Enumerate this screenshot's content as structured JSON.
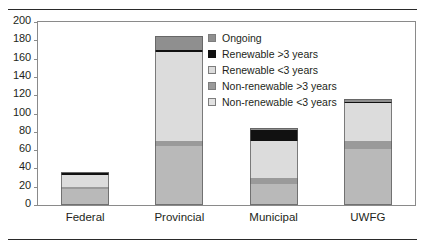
{
  "chart_data": {
    "type": "bar",
    "subtype": "stacked-vertical",
    "title": "",
    "xlabel": "",
    "ylabel": "",
    "ylim": [
      0,
      200
    ],
    "ytick_step": 20,
    "ytick_labels": [
      "0",
      "20",
      "40",
      "60",
      "80",
      "100",
      "120",
      "140",
      "160",
      "180",
      "200"
    ],
    "grid": false,
    "legend_position": "inside-top-right",
    "categories": [
      "Federal",
      "Provincial",
      "Municipal",
      "UWFG"
    ],
    "series": [
      {
        "name": "Non-renewable <3 years",
        "color": "#b9b9b9",
        "values": [
          18,
          65,
          23,
          61
        ]
      },
      {
        "name": "Non-renewable >3 years",
        "color": "#9a9a9a",
        "values": [
          2,
          5,
          7,
          9
        ]
      },
      {
        "name": "Renewable <3 years",
        "color": "#dcdcdc",
        "values": [
          13,
          97,
          40,
          42
        ]
      },
      {
        "name": "Renewable >3 years",
        "color": "#111111",
        "values": [
          2,
          2,
          12,
          1
        ]
      },
      {
        "name": "Ongoing",
        "color": "#8f8f8f",
        "values": [
          1,
          16,
          2,
          3
        ]
      }
    ],
    "stack_order_bottom_to_top": [
      "Non-renewable <3 years",
      "Non-renewable >3 years",
      "Renewable <3 years",
      "Renewable >3 years",
      "Ongoing"
    ],
    "totals": [
      36,
      185,
      84,
      116
    ],
    "legend_entries": [
      {
        "label": "Ongoing",
        "color": "#8f8f8f"
      },
      {
        "label": "Renewable >3 years",
        "color": "#111111"
      },
      {
        "label": "Renewable <3 years",
        "color": "#dcdcdc"
      },
      {
        "label": "Non-renewable >3 years",
        "color": "#9a9a9a"
      },
      {
        "label": "Non-renewable <3 years",
        "color": "#e2e2e2"
      }
    ]
  },
  "axis": {
    "frame_color": "#8a8a8a",
    "text_color": "#231f20"
  },
  "rules": {
    "color": "#2a2a2a"
  }
}
